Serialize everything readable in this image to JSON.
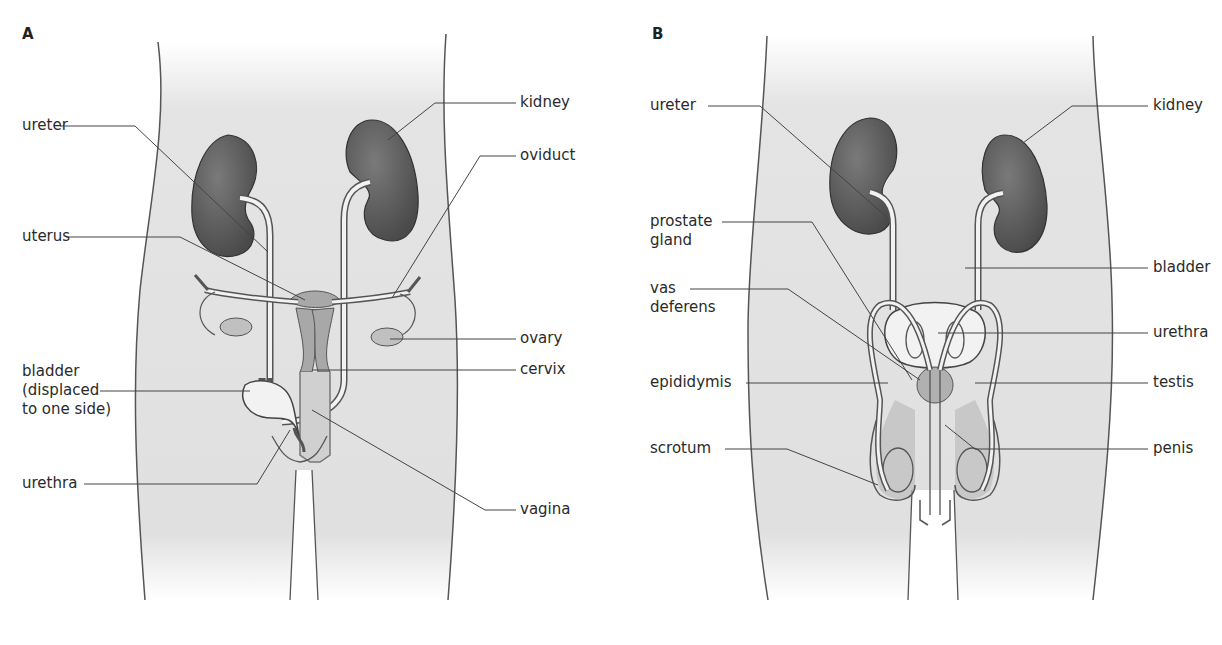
{
  "panels": [
    {
      "letter": "A",
      "labels": {
        "ureter": "ureter",
        "uterus": "uterus",
        "bladder": "bladder\n(displaced\nto one side)",
        "urethra": "urethra",
        "kidney": "kidney",
        "oviduct": "oviduct",
        "ovary": "ovary",
        "cervix": "cervix",
        "vagina": "vagina"
      }
    },
    {
      "letter": "B",
      "labels": {
        "ureter": "ureter",
        "prostate": "prostate\ngland",
        "vas": "vas\ndeferens",
        "epididymis": "epididymis",
        "scrotum": "scrotum",
        "kidney": "kidney",
        "bladder": "bladder",
        "urethra": "urethra",
        "testis": "testis",
        "penis": "penis"
      }
    }
  ],
  "colors": {
    "body_fill": "#e2e2e2",
    "kidney_fill": "#5e5e5e",
    "organ_mid": "#a8a8a8",
    "organ_light": "#f2f2f2",
    "outline": "#555555"
  }
}
